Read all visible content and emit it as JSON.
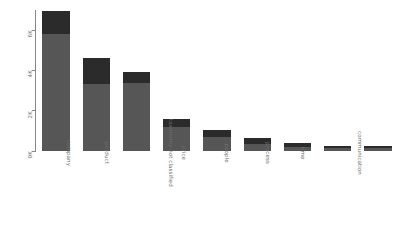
{
  "chart_data": {
    "type": "bar",
    "subtype": "stacked-bar",
    "title": "",
    "subtitle": "",
    "xlabel": "",
    "ylabel": "",
    "categories": [
      "company",
      "product",
      "taxonomy not classified",
      "price",
      "people",
      "process",
      "time",
      "communication",
      "environmental conditions"
    ],
    "series": [
      {
        "name": "base",
        "color": "#565656",
        "values": [
          5800,
          3350,
          3400,
          1180,
          700,
          330,
          200,
          130,
          130
        ]
      },
      {
        "name": "top",
        "color": "#2b2b2b",
        "values": [
          1150,
          1250,
          500,
          420,
          340,
          300,
          180,
          130,
          130
        ]
      }
    ],
    "totals": [
      6950,
      4600,
      3900,
      1600,
      1040,
      630,
      380,
      260,
      260
    ],
    "ylim": [
      0,
      7000
    ],
    "yticks": [
      0,
      2000,
      4000,
      6000
    ],
    "ytick_labels": [
      "0K",
      "2K",
      "4K",
      "6K"
    ],
    "grid": false,
    "legend": "none",
    "axis_color": "#888888",
    "label_color": "#6e6e6e",
    "background": "#ffffff"
  }
}
